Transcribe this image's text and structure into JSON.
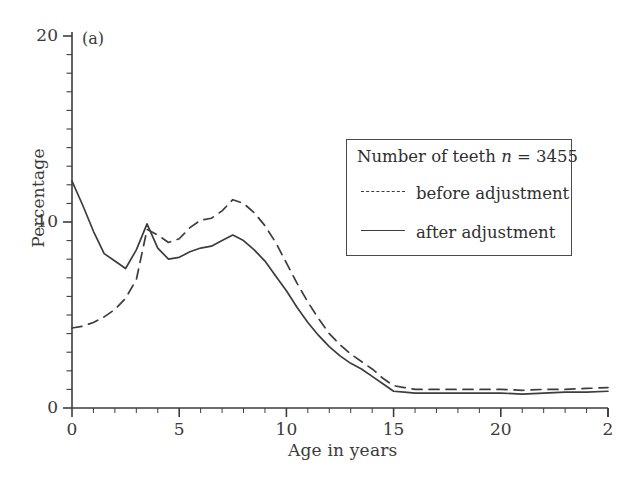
{
  "figure": {
    "panel_tag": "(a)",
    "background": "#ffffff",
    "ink_color": "#3d3d3d"
  },
  "legend": {
    "title_prefix": "Number of teeth ",
    "title_var": "n",
    "title_suffix": " = 3455",
    "entries": [
      {
        "label": "before adjustment",
        "style": "dashed"
      },
      {
        "label": "after adjustment",
        "style": "solid"
      }
    ]
  },
  "chart_data": {
    "type": "line",
    "title": "",
    "panel": "(a)",
    "xlabel": "Age in years",
    "ylabel": "Percentage",
    "xlim": [
      0,
      25
    ],
    "ylim": [
      0,
      20
    ],
    "xticks": [
      0,
      5,
      10,
      15,
      20,
      25
    ],
    "xtick_labels": [
      "0",
      "5",
      "10",
      "15",
      "20",
      "2"
    ],
    "yticks": [
      0,
      10,
      20
    ],
    "ytick_labels": [
      "0",
      "10",
      "20"
    ],
    "x_minor_tick_step": 1,
    "y_minor_tick_step": 1,
    "grid": false,
    "legend_position": "upper right",
    "annotation": "Number of teeth n = 3455",
    "series": [
      {
        "name": "before adjustment",
        "style": "dashed",
        "color": "#3d3d3d",
        "x": [
          0,
          0.5,
          1,
          1.5,
          2,
          2.5,
          3,
          3.5,
          4,
          4.5,
          5,
          5.5,
          6,
          6.5,
          7,
          7.5,
          8,
          8.5,
          9,
          9.5,
          10,
          10.5,
          11,
          11.5,
          12,
          12.5,
          13,
          13.5,
          14,
          14.5,
          15,
          15.5,
          16,
          17,
          18,
          19,
          20,
          21,
          22,
          23,
          24,
          25
        ],
        "y": [
          4.3,
          4.4,
          4.6,
          4.9,
          5.3,
          5.9,
          6.9,
          9.6,
          9.3,
          8.9,
          9.1,
          9.7,
          10.1,
          10.2,
          10.6,
          11.2,
          11.0,
          10.5,
          9.8,
          8.9,
          7.8,
          6.7,
          5.7,
          4.8,
          4.0,
          3.4,
          2.9,
          2.5,
          2.1,
          1.6,
          1.2,
          1.1,
          1.0,
          1.0,
          1.0,
          1.0,
          1.0,
          0.95,
          1.0,
          1.0,
          1.05,
          1.1
        ]
      },
      {
        "name": "after adjustment",
        "style": "solid",
        "color": "#3d3d3d",
        "x": [
          0,
          0.5,
          1,
          1.5,
          2,
          2.5,
          3,
          3.5,
          4,
          4.5,
          5,
          5.5,
          6,
          6.5,
          7,
          7.5,
          8,
          8.5,
          9,
          9.5,
          10,
          10.5,
          11,
          11.5,
          12,
          12.5,
          13,
          13.5,
          14,
          14.5,
          15,
          15.5,
          16,
          17,
          18,
          19,
          20,
          21,
          22,
          23,
          24,
          25
        ],
        "y": [
          12.2,
          10.9,
          9.5,
          8.3,
          7.9,
          7.5,
          8.5,
          9.9,
          8.6,
          8.0,
          8.1,
          8.4,
          8.6,
          8.7,
          9.0,
          9.3,
          9.0,
          8.5,
          7.9,
          7.1,
          6.3,
          5.4,
          4.6,
          3.9,
          3.3,
          2.8,
          2.4,
          2.1,
          1.7,
          1.3,
          0.9,
          0.85,
          0.8,
          0.8,
          0.8,
          0.8,
          0.8,
          0.75,
          0.8,
          0.85,
          0.85,
          0.9
        ]
      }
    ]
  }
}
